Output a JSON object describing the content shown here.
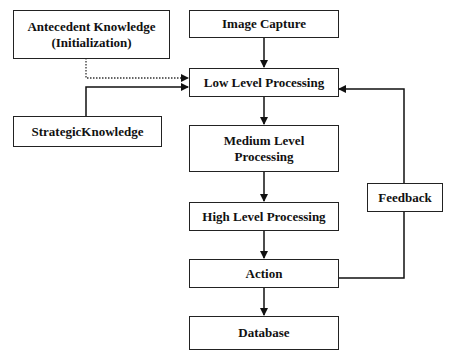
{
  "diagram": {
    "nodes": [
      {
        "id": "antecedent",
        "label": "Antecedent Knowledge",
        "sublabel": "(Initialization)"
      },
      {
        "id": "image_capture",
        "label": "Image Capture"
      },
      {
        "id": "low_level",
        "label": "Low Level Processing"
      },
      {
        "id": "strategic",
        "label": "StrategicKnowledge"
      },
      {
        "id": "medium_level",
        "label": "Medium Level",
        "sublabel": "Processing"
      },
      {
        "id": "high_level",
        "label": "High Level Processing"
      },
      {
        "id": "action",
        "label": "Action"
      },
      {
        "id": "database",
        "label": "Database"
      },
      {
        "id": "feedback",
        "label": "Feedback"
      }
    ],
    "edges": [
      {
        "from": "image_capture",
        "to": "low_level",
        "style": "solid"
      },
      {
        "from": "antecedent",
        "to": "low_level",
        "style": "dotted"
      },
      {
        "from": "strategic",
        "to": "low_level",
        "style": "solid"
      },
      {
        "from": "low_level",
        "to": "medium_level",
        "style": "solid"
      },
      {
        "from": "medium_level",
        "to": "high_level",
        "style": "solid"
      },
      {
        "from": "high_level",
        "to": "action",
        "style": "solid"
      },
      {
        "from": "action",
        "to": "database",
        "style": "solid"
      },
      {
        "from": "action",
        "to": "feedback",
        "style": "solid"
      },
      {
        "from": "feedback",
        "to": "low_level",
        "style": "solid"
      }
    ]
  }
}
